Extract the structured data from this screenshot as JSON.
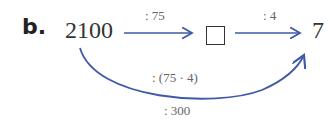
{
  "problem": {
    "label": "b.",
    "start": "2100",
    "result": "7",
    "step1_op": ": 75",
    "step2_op": ": 4",
    "combined_op": ": (75 · 4)",
    "combined_result": ": 300"
  },
  "colors": {
    "arrow": "#3f5aa6",
    "text": "#333333"
  }
}
